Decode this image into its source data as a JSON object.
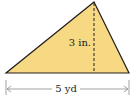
{
  "diagram": {
    "shape": "triangle",
    "fill_color": "#f6d982",
    "stroke_color": "#231f20",
    "height_label": "3 in.",
    "base_label": "5 yd",
    "vertices": {
      "left": [
        6,
        73
      ],
      "right": [
        129,
        73
      ],
      "apex": [
        94,
        2
      ]
    }
  }
}
